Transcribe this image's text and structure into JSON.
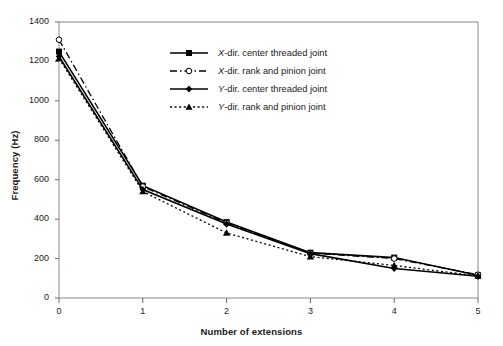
{
  "axes": {
    "xlabel": "Number of extensions",
    "ylabel": "Frequency (Hz)",
    "xticks": [
      "0",
      "1",
      "2",
      "3",
      "4",
      "5"
    ],
    "yticks": [
      "0",
      "200",
      "400",
      "600",
      "800",
      "1000",
      "1200",
      "1400"
    ]
  },
  "legend": {
    "items": [
      {
        "prefix": "X",
        "label": "-dir. center threaded joint",
        "full": "X-dir. center threaded joint",
        "marker": "square",
        "line": "solid"
      },
      {
        "prefix": "X",
        "label": "-dir. rank and pinion joint",
        "full": "X-dir. rank and pinion joint",
        "marker": "circle-open",
        "line": "dash-dot"
      },
      {
        "prefix": "Y",
        "label": "-dir. center threaded joint",
        "full": "Y-dir. center threaded joint",
        "marker": "diamond",
        "line": "solid"
      },
      {
        "prefix": "Y",
        "label": "-dir. rank and pinion joint",
        "full": "Y-dir. rank and pinion joint",
        "marker": "triangle",
        "line": "dotted"
      }
    ]
  },
  "chart_data": {
    "type": "line",
    "title": "",
    "xlabel": "Number of extensions",
    "ylabel": "Frequency (Hz)",
    "x": [
      0,
      1,
      2,
      3,
      4,
      5
    ],
    "xlim": [
      0,
      5
    ],
    "ylim": [
      0,
      1400
    ],
    "ytick_step": 200,
    "grid": false,
    "legend_position": "upper-center",
    "series": [
      {
        "name": "X-dir. center threaded joint",
        "marker": "square",
        "linestyle": "solid",
        "color": "#000000",
        "values": [
          1250,
          570,
          385,
          230,
          205,
          115
        ]
      },
      {
        "name": "X-dir. rank and pinion joint",
        "marker": "circle-open",
        "linestyle": "dash-dot",
        "color": "#000000",
        "values": [
          1310,
          565,
          380,
          228,
          200,
          118
        ]
      },
      {
        "name": "Y-dir. center threaded joint",
        "marker": "diamond",
        "linestyle": "solid",
        "color": "#000000",
        "values": [
          1225,
          550,
          375,
          225,
          150,
          110
        ]
      },
      {
        "name": "Y-dir. rank and pinion joint",
        "marker": "triangle",
        "linestyle": "dotted",
        "color": "#000000",
        "values": [
          1215,
          540,
          330,
          210,
          165,
          112
        ]
      }
    ]
  }
}
